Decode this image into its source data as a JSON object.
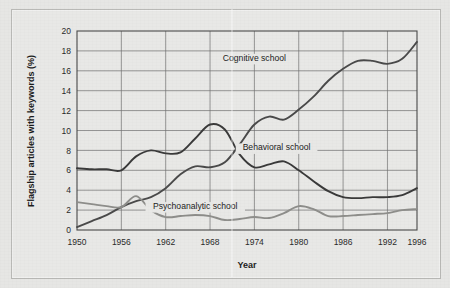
{
  "figure": {
    "name": "psychology-schools-keyword-trend-chart"
  },
  "chart_data": {
    "type": "line",
    "title": "",
    "xlabel": "Year",
    "ylabel": "Flagship articles with keywords (%)",
    "xlim": [
      1950,
      1996
    ],
    "ylim": [
      0,
      20
    ],
    "ytick_step": 2,
    "grid": true,
    "legend_position": "inline-annotations",
    "xticks": [
      1950,
      1956,
      1962,
      1968,
      1974,
      1980,
      1986,
      1992,
      1996
    ],
    "xtick_labels": [
      "1950",
      "1956",
      "1962",
      "1968",
      "1974",
      "1980",
      "1986",
      "1992",
      "1996"
    ],
    "yticks": [
      0,
      2,
      4,
      6,
      8,
      10,
      12,
      14,
      16,
      18,
      20
    ],
    "ytick_labels": [
      "0",
      "2",
      "4",
      "6",
      "8",
      "10",
      "12",
      "14",
      "16",
      "18",
      "20"
    ],
    "series": [
      {
        "name": "Cognitive school",
        "color": "#4a4a4a",
        "label_x": 1974,
        "label_y": 17.0,
        "x": [
          1950,
          1952,
          1954,
          1956,
          1958,
          1960,
          1962,
          1964,
          1966,
          1968,
          1970,
          1972,
          1974,
          1976,
          1978,
          1980,
          1982,
          1984,
          1986,
          1988,
          1990,
          1992,
          1994,
          1996
        ],
        "values": [
          0.3,
          0.9,
          1.5,
          2.3,
          2.9,
          3.3,
          4.2,
          5.6,
          6.4,
          6.3,
          6.8,
          8.6,
          10.6,
          11.4,
          11.1,
          12.1,
          13.4,
          15.0,
          16.2,
          17.0,
          17.0,
          16.7,
          17.2,
          18.9
        ]
      },
      {
        "name": "Behavioral school",
        "color": "#3a3a3a",
        "label_x": 1977,
        "label_y": 8.0,
        "x": [
          1950,
          1952,
          1954,
          1956,
          1958,
          1960,
          1962,
          1964,
          1966,
          1968,
          1970,
          1972,
          1974,
          1976,
          1978,
          1980,
          1982,
          1984,
          1986,
          1988,
          1990,
          1992,
          1994,
          1996
        ],
        "values": [
          6.2,
          6.1,
          6.1,
          6.0,
          7.4,
          8.0,
          7.7,
          7.8,
          9.2,
          10.6,
          10.1,
          7.6,
          6.3,
          6.6,
          6.9,
          6.0,
          4.9,
          3.9,
          3.3,
          3.2,
          3.3,
          3.3,
          3.5,
          4.2
        ]
      },
      {
        "name": "Psychoanalytic school",
        "color": "#8e8e8b",
        "label_x": 1966,
        "label_y": 2.1,
        "x": [
          1950,
          1952,
          1954,
          1956,
          1958,
          1960,
          1962,
          1964,
          1966,
          1968,
          1970,
          1972,
          1974,
          1976,
          1978,
          1980,
          1982,
          1984,
          1986,
          1988,
          1990,
          1992,
          1994,
          1996
        ],
        "values": [
          2.8,
          2.6,
          2.4,
          2.3,
          3.4,
          2.0,
          1.3,
          1.4,
          1.5,
          1.4,
          1.0,
          1.1,
          1.3,
          1.2,
          1.7,
          2.4,
          2.1,
          1.4,
          1.4,
          1.5,
          1.6,
          1.7,
          2.0,
          2.1
        ]
      }
    ]
  }
}
